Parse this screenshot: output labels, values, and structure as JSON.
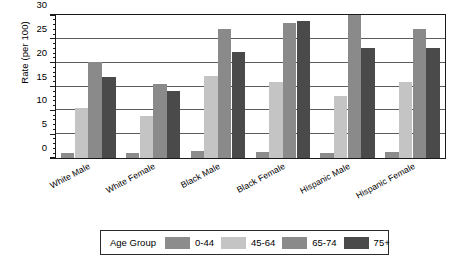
{
  "chart_data": {
    "type": "bar",
    "title": "",
    "xlabel": "",
    "ylabel": "Rate (per 100)",
    "ylim": [
      0,
      30
    ],
    "ytick_step": 5,
    "yticks": [
      0,
      5,
      10,
      15,
      20,
      25,
      30
    ],
    "ytick_labels": [
      "0",
      "5",
      "10",
      "15",
      "20",
      "25",
      "30"
    ],
    "minor_tick_step": 1,
    "grid": true,
    "grid_axis": "y",
    "legend_position": "below",
    "legend_title": "Age Group",
    "categories": [
      "White Male",
      "White Female",
      "Black Male",
      "Black Female",
      "Hispanic Male",
      "Hispanic Female"
    ],
    "series": [
      {
        "name": "0-44",
        "color": "#8c8c8c",
        "values": [
          1.0,
          1.1,
          1.4,
          1.3,
          1.0,
          1.3
        ]
      },
      {
        "name": "45-64",
        "color": "#c4c4c4",
        "values": [
          10.4,
          8.9,
          17.3,
          16.0,
          13.1,
          16.0
        ]
      },
      {
        "name": "65-74",
        "color": "#8a8a8a",
        "values": [
          20.2,
          15.6,
          27.0,
          28.3,
          30.0,
          27.0
        ]
      },
      {
        "name": "75+",
        "color": "#4a4a4a",
        "values": [
          17.0,
          14.1,
          22.2,
          28.7,
          23.0,
          23.0
        ]
      }
    ]
  },
  "legend": {
    "title": "Age Group",
    "entries": [
      {
        "label": "0-44",
        "color": "#8c8c8c"
      },
      {
        "label": "45-64",
        "color": "#c4c4c4"
      },
      {
        "label": "65-74",
        "color": "#8a8a8a"
      },
      {
        "label": "75+",
        "color": "#4a4a4a"
      }
    ]
  },
  "axes": {
    "y_title": "Rate (per 100)"
  },
  "colors": {
    "frame": "#1a1a1a",
    "grid": "#5c5c5c",
    "background": "#ffffff",
    "text": "#000000"
  }
}
